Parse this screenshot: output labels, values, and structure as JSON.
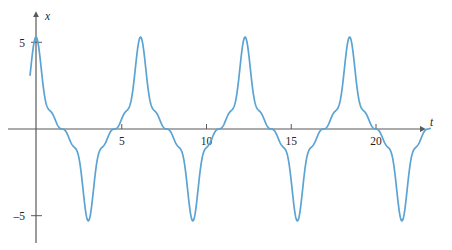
{
  "figure": {
    "background": "#ffffff",
    "line_color": "#5ba3d2",
    "axis_color": "#58595b",
    "text_color": "#231f20"
  },
  "chart_data": {
    "type": "line",
    "title": "",
    "subtitle": "",
    "xlabel": "t",
    "ylabel": "x",
    "grid": false,
    "legend": null,
    "annotations": [],
    "xlim": [
      -0.35,
      23.2
    ],
    "ylim": [
      -6.9,
      6.9
    ],
    "xticks": [
      5,
      10,
      15,
      20
    ],
    "xtick_labels": [
      "5",
      "10",
      "15",
      "20"
    ],
    "yticks": [
      5,
      -5
    ],
    "ytick_labels": [
      "5",
      "–5"
    ],
    "axis_arrows": {
      "x": "right",
      "y": "up"
    },
    "series": [
      {
        "name": "x(t)",
        "period": 6.15,
        "amplitude_max": 5.0,
        "amplitude_min": -5.0,
        "x": [
          0.0,
          0.12,
          0.25,
          0.37,
          0.49,
          0.62,
          0.74,
          0.86,
          0.98,
          1.11,
          1.23,
          1.35,
          1.48,
          1.6,
          1.72,
          1.85,
          1.97,
          2.09,
          2.21,
          2.34,
          2.46,
          2.58,
          2.71,
          2.83,
          2.95,
          3.08,
          3.2,
          3.32,
          3.44,
          3.57,
          3.69,
          3.81,
          3.94,
          4.06,
          4.18,
          4.31,
          4.43,
          4.55,
          4.67,
          4.8,
          4.92,
          5.04,
          5.17,
          5.29,
          5.41,
          5.54,
          5.66,
          5.78,
          5.9,
          6.03,
          6.15,
          6.27,
          6.4,
          6.52,
          6.64,
          6.77,
          6.89,
          7.01,
          7.13,
          7.26,
          7.38,
          7.5,
          7.63,
          7.75,
          7.87,
          8.0,
          8.12,
          8.24,
          8.36,
          8.49,
          8.61,
          8.73,
          8.86,
          8.98,
          9.1,
          9.23,
          9.35,
          9.47,
          9.59,
          9.72,
          9.84,
          9.96,
          10.09,
          10.21,
          10.33,
          10.46,
          10.58,
          10.7,
          10.82,
          10.95,
          11.07,
          11.19,
          11.32,
          11.44,
          11.56,
          11.69,
          11.81,
          11.93,
          12.05,
          12.18,
          12.3,
          12.42,
          12.55,
          12.67,
          12.79,
          12.92,
          13.04,
          13.16,
          13.28,
          13.41,
          13.53,
          13.65,
          13.78,
          13.9,
          14.02,
          14.15,
          14.27,
          14.39,
          14.51,
          14.64,
          14.76,
          14.88,
          15.01,
          15.13,
          15.25,
          15.38,
          15.5,
          15.62,
          15.74,
          15.87,
          15.99,
          16.11,
          16.24,
          16.36,
          16.48,
          16.61,
          16.73,
          16.85,
          16.97,
          17.1,
          17.22,
          17.34,
          17.47,
          17.59,
          17.71,
          17.84,
          17.96,
          18.08,
          18.2,
          18.33,
          18.45,
          18.57,
          18.7,
          18.82,
          18.94,
          19.07,
          19.19,
          19.31,
          19.43,
          19.56,
          19.68,
          19.8,
          19.93,
          20.05,
          20.17,
          20.3,
          20.42,
          20.54,
          20.66,
          20.79,
          20.91,
          21.03,
          21.16,
          21.28,
          21.4,
          21.53,
          21.65,
          21.77,
          21.89,
          22.02,
          22.14,
          22.26,
          22.39,
          22.51,
          22.63,
          22.76,
          22.88,
          23.0
        ],
        "formula": "3.1*cos(2*pi*t/6.15) + 1.25*cos(3*2*pi*t/6.15) + 0.62*cos(5*2*pi*t/6.15) + 0.33*cos(7*2*pi*t/6.15)"
      }
    ]
  }
}
